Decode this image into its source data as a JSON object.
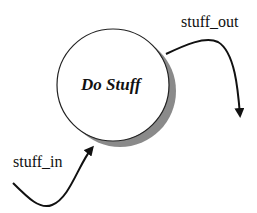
{
  "diagram": {
    "type": "data-flow",
    "process": {
      "label": "Do Stuff",
      "shape": "circle-with-shadow",
      "fill": "#ffffff",
      "shadow_color": "#8a8a8a"
    },
    "flows": [
      {
        "label": "stuff_in",
        "direction": "into-process"
      },
      {
        "label": "stuff_out",
        "direction": "out-of-process"
      }
    ],
    "stroke_color": "#111111"
  }
}
